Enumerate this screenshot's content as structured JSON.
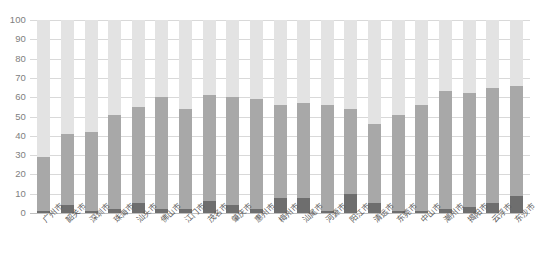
{
  "chart_data": {
    "type": "bar",
    "stacked": true,
    "title": "",
    "subtitle": "",
    "xlabel": "",
    "ylabel": "",
    "ylim": [
      0,
      100
    ],
    "ytick_labels": [
      "100",
      "90",
      "80",
      "70",
      "60",
      "50",
      "40",
      "30",
      "20",
      "10",
      "0"
    ],
    "ytick_values": [
      100,
      90,
      80,
      70,
      60,
      50,
      40,
      30,
      20,
      10,
      0
    ],
    "grid": true,
    "legend": "none",
    "categories": [
      "广州市",
      "韶关市",
      "深圳市",
      "珠海市",
      "汕头市",
      "佛山市",
      "江门市",
      "茂名市",
      "肇庆市",
      "惠州市",
      "梅州市",
      "汕尾市",
      "河源市",
      "阳江市",
      "清远市",
      "东莞市",
      "中山市",
      "潮州市",
      "揭阳市",
      "云浮市",
      "东沙市"
    ],
    "series": [
      {
        "name": "bottom",
        "color": "#6e6e6e",
        "values": [
          1,
          4,
          1,
          2,
          5,
          2,
          2,
          6,
          4,
          2,
          8,
          8,
          1,
          10,
          5,
          1,
          1,
          2,
          3,
          5,
          9
        ]
      },
      {
        "name": "middle",
        "color": "#a8a8a8",
        "values": [
          28,
          37,
          41,
          49,
          50,
          58,
          52,
          55,
          56,
          57,
          48,
          49,
          55,
          44,
          41,
          50,
          55,
          61,
          59,
          60,
          57
        ]
      },
      {
        "name": "top",
        "color": "#e3e3e3",
        "values": [
          71,
          59,
          58,
          49,
          45,
          40,
          46,
          39,
          40,
          41,
          44,
          43,
          44,
          46,
          54,
          49,
          44,
          37,
          38,
          35,
          34
        ]
      }
    ],
    "cumulative_tops": [
      29,
      41,
      42,
      51,
      55,
      60,
      54,
      61,
      60,
      59,
      56,
      57,
      56,
      54,
      46,
      51,
      56,
      63,
      62,
      65,
      66
    ]
  },
  "axis": {
    "y_max": 100,
    "y_min": 0
  }
}
